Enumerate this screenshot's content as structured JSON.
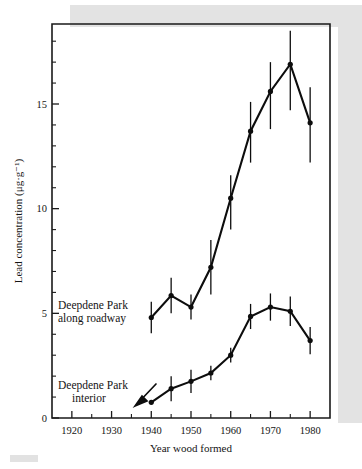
{
  "chart_data": {
    "type": "line",
    "title": "",
    "xlabel": "Year wood formed",
    "ylabel": "Lead concentration (μg·g⁻¹)",
    "xlim": [
      1915,
      1985
    ],
    "ylim": [
      0,
      18.5
    ],
    "xticks": [
      1920,
      1930,
      1940,
      1950,
      1960,
      1970,
      1980
    ],
    "xticklabels": [
      "1920",
      "1930",
      "1940",
      "1950",
      "1960",
      "1970",
      "1980"
    ],
    "xminorticks": [
      1925,
      1935,
      1945,
      1955,
      1965,
      1975
    ],
    "yticks": [
      0,
      5,
      10,
      15
    ],
    "yticklabels": [
      "0",
      "5",
      "10",
      "15"
    ],
    "yminorticks": [
      1,
      2,
      3,
      4,
      6,
      7,
      8,
      9,
      11,
      12,
      13,
      14,
      16,
      17,
      18
    ],
    "grid": false,
    "legend": "annotations-inline",
    "x": [
      1940,
      1945,
      1950,
      1955,
      1960,
      1965,
      1970,
      1975,
      1980
    ],
    "series": [
      {
        "name": "Deepdene Park along roadway",
        "values": [
          4.8,
          5.85,
          5.3,
          7.2,
          10.5,
          13.7,
          15.6,
          16.9,
          14.1
        ],
        "err_low": [
          0.75,
          0.85,
          0.6,
          1.3,
          1.5,
          1.5,
          1.8,
          2.2,
          1.9
        ],
        "err_high": [
          0.75,
          0.85,
          0.6,
          1.3,
          1.1,
          1.4,
          1.4,
          1.6,
          1.7
        ]
      },
      {
        "name": "Deepdene Park interior",
        "values": [
          0.75,
          1.4,
          1.75,
          2.15,
          3.0,
          4.85,
          5.3,
          5.1,
          3.7
        ],
        "err_low": [
          0.0,
          0.6,
          0.55,
          0.35,
          0.35,
          0.6,
          0.65,
          0.7,
          0.65
        ],
        "err_high": [
          0.0,
          0.6,
          0.55,
          0.35,
          0.35,
          0.6,
          0.65,
          0.7,
          0.65
        ]
      }
    ],
    "annotations": [
      {
        "id": "roadway",
        "line1": "Deepdene Park",
        "line2": "along roadway"
      },
      {
        "id": "interior",
        "line1": "Deepdene Park",
        "line2": "interior"
      }
    ],
    "colors": {
      "line": "#0d0d0d",
      "marker": "#0d0d0d",
      "axis": "#1a1a1a"
    }
  }
}
